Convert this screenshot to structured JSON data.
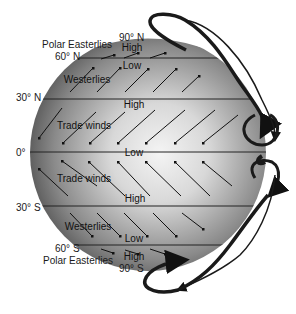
{
  "diagram": {
    "type": "global-wind-circulation",
    "latitudes": {
      "n90": "90° N",
      "n60": "60° N",
      "n30": "30° N",
      "eq": "0°",
      "s30": "30° S",
      "s60": "60° S",
      "s90": "90° S"
    },
    "pressure": {
      "north_pole": "High",
      "n60": "Low",
      "n30": "High",
      "equator": "Low",
      "s30": "High",
      "s60": "Low",
      "south_pole": "High"
    },
    "winds": {
      "north_polar": "Polar Easterlies",
      "north_westerlies": "Westerlies",
      "north_trades": "Trade winds",
      "south_trades": "Trade winds",
      "south_westerlies": "Westerlies",
      "south_polar": "Polar Easterlies"
    },
    "colors": {
      "globe_dark": "#4a4a4a",
      "globe_light": "#f2f2f2",
      "lines": "#222222",
      "background": "#ffffff"
    },
    "cells": [
      "Polar cell N",
      "Ferrel cell N",
      "Hadley cell N",
      "Hadley cell S",
      "Ferrel cell S",
      "Polar cell S"
    ]
  }
}
